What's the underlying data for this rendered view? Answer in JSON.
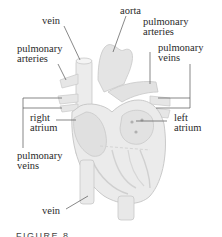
{
  "figure": {
    "caption": "FIGURE 8",
    "colors": {
      "tissue": "#e6e6e6",
      "tissue_shade": "#d2d2d2",
      "outline": "#c4c4c4",
      "leader_line": "#555555",
      "text": "#2a2a2a"
    },
    "labels": {
      "vein_top": "vein",
      "aorta": "aorta",
      "pulmonary_arteries_right": "pulmonary\narteries",
      "pulmonary_arteries_left": "pulmonary\narteries",
      "pulmonary_veins_right": "pulmonary\nveins",
      "right_atrium": "right\natrium",
      "left_atrium": "left\natrium",
      "pulmonary_veins_left": "pulmonary\nveins",
      "vein_bottom": "vein"
    }
  }
}
